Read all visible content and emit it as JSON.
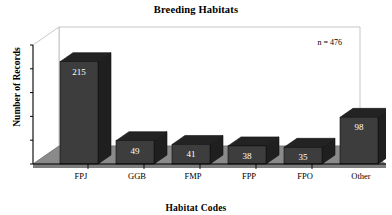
{
  "chart_data": {
    "type": "bar",
    "title": "Breeding Habitats",
    "xlabel": "Habitat Codes",
    "ylabel": "Number of Records",
    "categories": [
      "FPJ",
      "GGB",
      "FMP",
      "FPP",
      "FPO",
      "Other"
    ],
    "values": [
      215,
      49,
      41,
      38,
      35,
      98
    ],
    "ylim": [
      0,
      250
    ],
    "yticks": [
      0,
      50,
      100,
      150,
      200,
      250
    ],
    "ytick_labels": [
      "0",
      "50",
      "100",
      "150",
      "200",
      "250"
    ],
    "grid": false,
    "legend": null,
    "annotation": "n = 476",
    "annotation_position": "top-right",
    "style": "3d-column",
    "colors": {
      "bar_front": "#3d3d3d",
      "bar_side": "#1f1f1f",
      "bar_top": "#232323",
      "floor": "#8a8a8a",
      "floor_edge": "#6f6f6f",
      "wall": "#ffffff",
      "wall_outline": "#b9b9b9",
      "axis": "#000000",
      "value_label": "#ffffff"
    }
  },
  "figure": {
    "title": "Breeding Habitats",
    "annotation": "n = 476",
    "axis_x_title": "Habitat Codes",
    "axis_y_title": "Number of Records"
  },
  "bars": [
    {
      "category": "FPJ",
      "value": 215,
      "label": "215"
    },
    {
      "category": "GGB",
      "value": 49,
      "label": "49"
    },
    {
      "category": "FMP",
      "value": 41,
      "label": "41"
    },
    {
      "category": "FPP",
      "value": 38,
      "label": "38"
    },
    {
      "category": "FPO",
      "value": 35,
      "label": "35"
    },
    {
      "category": "Other",
      "value": 98,
      "label": "98"
    }
  ],
  "yticks": [
    {
      "label": "250"
    },
    {
      "label": "200"
    },
    {
      "label": "150"
    },
    {
      "label": "100"
    },
    {
      "label": "50"
    },
    {
      "label": "0"
    }
  ]
}
